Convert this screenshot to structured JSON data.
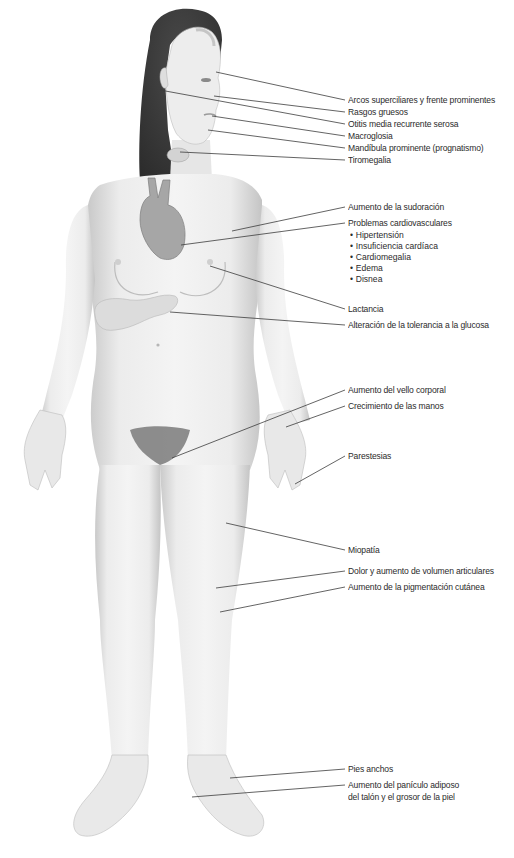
{
  "figure": {
    "colors": {
      "skin": "#ececec",
      "skin_shadow": "#c9c9c9",
      "hair": "#3a3a3a",
      "heart": "#9a9a9a",
      "line": "#3c3c3c",
      "text": "#2b2b2b"
    }
  },
  "labels": [
    {
      "id": "arcos",
      "text": "Arcos superciliares y frente prominentes",
      "y": 95
    },
    {
      "id": "rasgos",
      "text": "Rasgos gruesos",
      "y": 107
    },
    {
      "id": "otitis",
      "text": "Otitis media recurrente serosa",
      "y": 119
    },
    {
      "id": "macroglosia",
      "text": "Macroglosia",
      "y": 131
    },
    {
      "id": "mandibula",
      "text": "Mandíbula prominente (prognatismo)",
      "y": 143
    },
    {
      "id": "tiromegalia",
      "text": "Tiromegalia",
      "y": 155
    },
    {
      "id": "sudoracion",
      "text": "Aumento de la sudoración",
      "y": 202
    },
    {
      "id": "cardio",
      "text": "Problemas cardiovasculares",
      "y": 218
    },
    {
      "id": "lactancia",
      "text": "Lactancia",
      "y": 304
    },
    {
      "id": "glucosa",
      "text": "Alteración de la tolerancia a la glucosa",
      "y": 320
    },
    {
      "id": "vello",
      "text": "Aumento del vello corporal",
      "y": 385
    },
    {
      "id": "manos",
      "text": "Crecimiento de las manos",
      "y": 401
    },
    {
      "id": "parestesias",
      "text": "Parestesias",
      "y": 451
    },
    {
      "id": "miopatia",
      "text": "Miopatía",
      "y": 545
    },
    {
      "id": "dolor",
      "text": "Dolor y aumento de volumen articulares",
      "y": 566
    },
    {
      "id": "pigmentacion",
      "text": "Aumento de la pigmentación cutánea",
      "y": 582
    },
    {
      "id": "pies",
      "text": "Pies anchos",
      "y": 764
    },
    {
      "id": "paniculo_1",
      "text": "Aumento del panículo adiposo",
      "y": 780
    },
    {
      "id": "paniculo_2",
      "text": "del talón y el grosor de la piel",
      "y": 792
    }
  ],
  "cardio_subitems": [
    "Hipertensión",
    "Insuficiencia cardíaca",
    "Cardiomegalia",
    "Edema",
    "Disnea"
  ]
}
